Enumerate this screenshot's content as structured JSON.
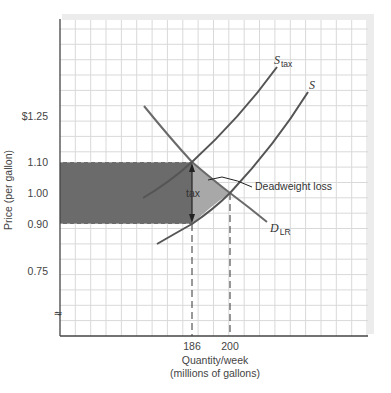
{
  "chart_data": {
    "type": "line",
    "title": "",
    "xlabel": "Quantity/week\n(millions of gallons)",
    "xlabel_lines": [
      "Quantity/week",
      "(millions of gallons)"
    ],
    "ylabel": "Price (per gallon)",
    "y_ticks": [
      {
        "label": "$1.25",
        "value": 1.25
      },
      {
        "label": "1.10",
        "value": 1.1
      },
      {
        "label": "1.00",
        "value": 1.0
      },
      {
        "label": "0.90",
        "value": 0.9
      },
      {
        "label": "0.75",
        "value": 0.75
      }
    ],
    "x_ticks": [
      {
        "label": "186",
        "value": 186
      },
      {
        "label": "200",
        "value": 200
      }
    ],
    "axis_break_symbol": "≈",
    "grid": true,
    "series": [
      {
        "name": "S_tax",
        "label_main": "S",
        "label_sub": "tax",
        "type": "supply with tax",
        "points": [
          [
            170,
            0.98
          ],
          [
            186,
            1.1
          ],
          [
            200,
            1.2
          ],
          [
            214,
            1.4
          ]
        ]
      },
      {
        "name": "S",
        "label_main": "S",
        "label_sub": "",
        "type": "supply",
        "points": [
          [
            174,
            0.83
          ],
          [
            186,
            0.9
          ],
          [
            200,
            1.0
          ],
          [
            226,
            1.33
          ]
        ]
      },
      {
        "name": "D_LR",
        "label_main": "D",
        "label_sub": "LR",
        "type": "long-run demand",
        "points": [
          [
            170,
            1.29
          ],
          [
            186,
            1.1
          ],
          [
            200,
            1.0
          ],
          [
            212,
            0.91
          ]
        ]
      }
    ],
    "equilibria": [
      {
        "label": "no tax",
        "quantity": 200,
        "price": 1.0
      },
      {
        "label": "with tax",
        "quantity": 186,
        "buyer_price": 1.1,
        "seller_price": 0.9
      }
    ],
    "tax_per_gallon": 0.2,
    "regions": [
      {
        "name": "tax revenue",
        "x_range": [
          0,
          186
        ],
        "y_range": [
          0.9,
          1.1
        ],
        "color": "#6b6b6b"
      },
      {
        "name": "deadweight loss",
        "vertices": [
          [
            186,
            1.1
          ],
          [
            200,
            1.0
          ],
          [
            186,
            0.9
          ]
        ],
        "color": "#a8a8a8"
      }
    ],
    "annotations": [
      {
        "text": "tax",
        "type": "double-arrow",
        "from_price": 0.9,
        "to_price": 1.1,
        "at_quantity": 186
      },
      {
        "text": "Deadweight loss",
        "type": "leader-line"
      }
    ],
    "colors": {
      "curve": "#5a5a5a",
      "tax_rect": "#6b6b6b",
      "dwl": "#a8a8a8",
      "grid": "#d9d9d9",
      "frame": "#e6e6e6"
    }
  }
}
